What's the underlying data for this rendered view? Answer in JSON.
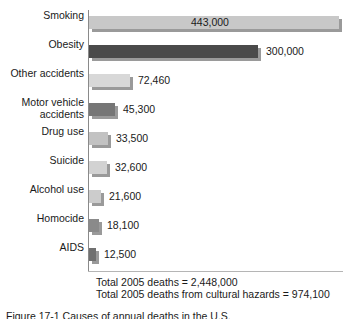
{
  "chart_data": {
    "type": "bar",
    "orientation": "horizontal",
    "title": "",
    "xlabel": "",
    "ylabel": "",
    "xlim": [
      0,
      443000
    ],
    "grid": false,
    "legend": null,
    "categories": [
      "Smoking",
      "Obesity",
      "Other accidents",
      "Motor vehicle\naccidents",
      "Drug use",
      "Suicide",
      "Alcohol use",
      "Homocide",
      "AIDS"
    ],
    "values": [
      443000,
      300000,
      72460,
      45300,
      33500,
      32600,
      21600,
      18100,
      12500
    ],
    "value_labels": [
      "443,000",
      "300,000",
      "72,460",
      "45,300",
      "33,500",
      "32,600",
      "21,600",
      "18,100",
      "12,500"
    ],
    "bar_colors": [
      "#c8c8c8",
      "#4a4a4a",
      "#d8d8d8",
      "#767676",
      "#c2c2c2",
      "#d2d2d2",
      "#cccccc",
      "#8a8a8a",
      "#707070"
    ],
    "label_inside": [
      true,
      false,
      false,
      false,
      false,
      false,
      false,
      false,
      false
    ],
    "annotations": [
      "Total 2005 deaths = 2,448,000",
      "Total 2005 deaths from cultural hazards = 974,100"
    ]
  },
  "totals": {
    "line1": "Total 2005 deaths = 2,448,000",
    "line2": "Total 2005 deaths from cultural hazards = 974,100"
  },
  "figure_caption": {
    "text": "Figure 17-1 Causes of annual deaths in the U.S."
  }
}
